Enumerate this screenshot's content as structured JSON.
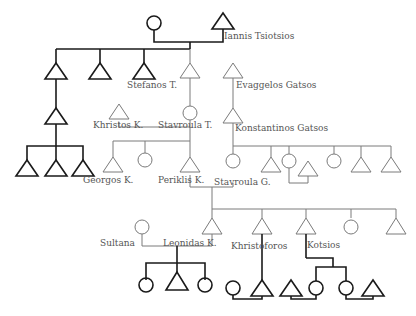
{
  "colors": {
    "bold_stroke": "#1a1a1a",
    "thin_stroke": "#7a7a7a",
    "label_text": "#555555",
    "background": "#ffffff"
  },
  "legend_implied": {
    "triangle": "male",
    "circle": "female"
  },
  "labels": {
    "iannis": "Iannis Tsiotsios",
    "stefanos": "Stefanos T.",
    "evaggelos": "Evaggelos Gatsos",
    "khristos": "Khristos K.",
    "stavroula_t": "Stavroula T.",
    "konstantinos": "Konstantinos Gatsos",
    "georgos": "Georgos K.",
    "periklis": "Periklis K.",
    "stavroula_g": "Stavroula G.",
    "sultana": "Sultana",
    "leonidas": "Leonidas K.",
    "khristoforos": "Khristoforos",
    "kotsios": "Kotsios"
  },
  "generations": [
    {
      "gen": 1,
      "members": [
        "female (unnamed)",
        "Iannis Tsiotsios"
      ]
    },
    {
      "gen": 2,
      "members": [
        "male",
        "male",
        "Stefanos T.",
        "male",
        "Evaggelos Gatsos"
      ]
    },
    {
      "gen": 3,
      "members": [
        "male",
        "Khristos K.",
        "Stavroula T.",
        "Konstantinos Gatsos"
      ]
    },
    {
      "gen": 4,
      "members": [
        "male",
        "male",
        "male",
        "Georgos K.",
        "female",
        "Periklis K.",
        "Stavroula G.",
        "male",
        "female",
        "male",
        "female",
        "male",
        "male"
      ]
    },
    {
      "gen": 5,
      "members": [
        "Sultana",
        "Leonidas K.",
        "Khristoforos",
        "Kotsios",
        "female",
        "male"
      ]
    },
    {
      "gen": 6,
      "members": [
        "female",
        "male",
        "female",
        "female",
        "male",
        "male",
        "female",
        "female",
        "male"
      ]
    }
  ]
}
